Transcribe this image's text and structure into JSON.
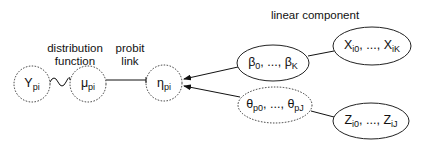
{
  "labels": {
    "distribution": "distribution",
    "function": "function",
    "probit": "probit",
    "link": "link",
    "linear_component": "linear component"
  },
  "nodes": {
    "y": {
      "sym": "Y",
      "sub": "pi"
    },
    "mu": {
      "sym": "μ",
      "sub": "pi"
    },
    "eta": {
      "sym": "η",
      "sub": "pi"
    },
    "beta": {
      "sym_a": "β",
      "sub_a": "0",
      "sep": ", ..., ",
      "sym_b": "β",
      "sub_b": "K"
    },
    "theta": {
      "sym_a": "θ",
      "sub_a": "p0",
      "sep": ", ..., ",
      "sym_b": "θ",
      "sub_b": "pJ"
    },
    "x": {
      "sym_a": "X",
      "sub_a": "i0",
      "sep": ", ..., ",
      "sym_b": "X",
      "sub_b": "iK"
    },
    "z": {
      "sym_a": "Z",
      "sub_a": "i0",
      "sep": ", ..., ",
      "sym_b": "Z",
      "sub_b": "iJ"
    }
  }
}
